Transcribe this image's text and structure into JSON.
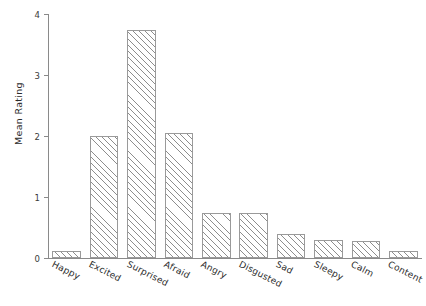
{
  "chart_data": {
    "type": "bar",
    "title": "",
    "subtitle": "",
    "xlabel": "",
    "ylabel": "Mean Rating",
    "categories": [
      "Happy",
      "Excited",
      "Surprised",
      "Afraid",
      "Angry",
      "Disgusted",
      "Sad",
      "Sleepy",
      "Calm",
      "Content"
    ],
    "values": [
      0.12,
      2.0,
      3.73,
      2.05,
      0.73,
      0.73,
      0.4,
      0.3,
      0.28,
      0.12
    ],
    "ylim": [
      0,
      4
    ],
    "yticks": [
      0,
      1,
      2,
      3,
      4
    ],
    "ytick_labels": [
      "0",
      "1",
      "2",
      "3",
      "4"
    ],
    "grid": false,
    "legend": null,
    "bar_style": {
      "fill": "#ffffff",
      "edge_color": "#9a9a9a",
      "hatch": "diagonal",
      "hatch_color": "#8d8d8d"
    },
    "axis_color": "#8a8a8a",
    "text_color": "#2b2b2b",
    "xtick_rotation": 27
  }
}
